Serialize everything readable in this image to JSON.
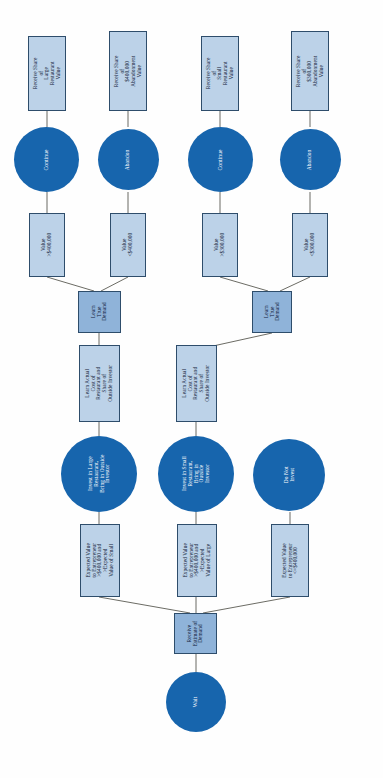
{
  "diagram": {
    "orientation": "rotated-90-ccw",
    "colors": {
      "circle_fill": "#1765ad",
      "circle_text": "#ffffff",
      "rect_light_fill": "#bcd2e8",
      "rect_mid_fill": "#8fb3d9",
      "rect_border": "#2e4d6b",
      "rect_text": "#14243a",
      "edge": "#5a5a52",
      "background": "#ffffff"
    },
    "nodes": [
      {
        "id": "n1",
        "shape": "rect-light",
        "label": "Receive Share of\nLarge\nRestaurant\nValue"
      },
      {
        "id": "n2",
        "shape": "rect-light",
        "label": "Receive Share of\n$400,000\nAbandonment\nValue"
      },
      {
        "id": "n3",
        "shape": "rect-light",
        "label": "Receive Share of\nSmall\nRestaurant\nValue"
      },
      {
        "id": "n4",
        "shape": "rect-light",
        "label": "Receive Share of\n$300,000\nAbandonment\nValue"
      },
      {
        "id": "n5",
        "shape": "circle",
        "label": "Continue"
      },
      {
        "id": "n6",
        "shape": "circle",
        "label": "Abandon"
      },
      {
        "id": "n7",
        "shape": "circle",
        "label": "Continue"
      },
      {
        "id": "n8",
        "shape": "circle",
        "label": "Abandon"
      },
      {
        "id": "n9",
        "shape": "rect-light",
        "label": "Value\n>$400,000"
      },
      {
        "id": "n10",
        "shape": "rect-light",
        "label": "Value\n<$400,000"
      },
      {
        "id": "n11",
        "shape": "rect-light",
        "label": "Value\n>$300,000"
      },
      {
        "id": "n12",
        "shape": "rect-light",
        "label": "Value\n<$300,000"
      },
      {
        "id": "n13",
        "shape": "rect-mid",
        "label": "Learn\nTrue\nDemand"
      },
      {
        "id": "n14",
        "shape": "rect-mid",
        "label": "Learn\nTrue\nDemand"
      },
      {
        "id": "n15",
        "shape": "rect-light",
        "label": "Learn Actual\nCost of\nRestaurant and\nShare of\nOutside Investor"
      },
      {
        "id": "n16",
        "shape": "rect-light",
        "label": "Learn Actual\nCost of\nRestaurant and\nShare of\nOutside Investor"
      },
      {
        "id": "n17",
        "shape": "circle",
        "label": "Invest in Large\nRestaurant,\nBring in Outside\nInvestor"
      },
      {
        "id": "n18",
        "shape": "circle",
        "label": "Invest in Small\nRestaurant,\nBring in\nOutside\nInvestor"
      },
      {
        "id": "n19",
        "shape": "circle",
        "label": "Do Not\nInvest"
      },
      {
        "id": "n20",
        "shape": "rect-light",
        "label": "Expected Value\nto Entrepreneur\n>$400,000 and\n>Expected\nValue of Small"
      },
      {
        "id": "n21",
        "shape": "rect-light",
        "label": "Expected Value\nto Entrepreneur\n>$400,000 and\n>Expected\nValue of Large"
      },
      {
        "id": "n22",
        "shape": "rect-light",
        "label": "Expected Value\nto Entrepreneur\n<=$400,000"
      },
      {
        "id": "n23",
        "shape": "rect-mid",
        "label": "Receive\nEstimate of\nDemand"
      },
      {
        "id": "n24",
        "shape": "circle",
        "label": "Wait"
      }
    ]
  }
}
